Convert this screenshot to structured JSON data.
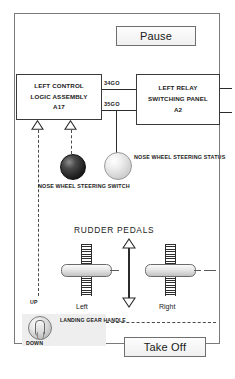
{
  "diagram": {
    "blocks": [
      {
        "id": "left-control-logic-assembly",
        "lines": [
          "LEFT CONTROL",
          "LOGIC ASSEMBLY",
          "A17"
        ]
      },
      {
        "id": "left-relay-switching-panel",
        "lines": [
          "LEFT RELAY",
          "SWITCHING PANEL",
          "A2"
        ]
      }
    ],
    "wire_labels": {
      "upper": "34GO",
      "lower": "35GO"
    },
    "lamps": {
      "switch": {
        "name": "nose-wheel-steering-switch",
        "caption": [
          "NOSE WHEEL",
          "STEERING",
          "SWITCH"
        ],
        "color": "#1c1c1c"
      },
      "status": {
        "name": "nose-wheel-steering-status",
        "caption": [
          "NOSE WHEEL",
          "STEERING",
          "STATUS"
        ],
        "color": "#e3e3e3"
      }
    },
    "rudder": {
      "title": "RUDDER PEDALS",
      "left_label": "Left",
      "right_label": "Right"
    },
    "linkage": {
      "up_label": "UP",
      "down_label": "DOWN"
    },
    "landing_gear": {
      "caption": [
        "LANDING",
        "GEAR",
        "HANDLE"
      ]
    }
  },
  "buttons": {
    "pause": "Pause",
    "take_off": "Take Off"
  }
}
